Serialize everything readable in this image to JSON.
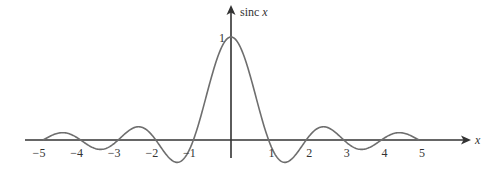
{
  "chart_data": {
    "type": "line",
    "title": "",
    "function": "sinc x = sin(πx)/(πx)",
    "xlabel": "x",
    "ylabel": "sinc x",
    "ylabel_parts": {
      "name": "sinc",
      "var": "x"
    },
    "x_ticks": [
      -5,
      -4,
      -3,
      -2,
      -1,
      1,
      2,
      3,
      4,
      5
    ],
    "x_tick_labels": [
      "−5",
      "−4",
      "−3",
      "−2",
      "−1",
      "1",
      "2",
      "3",
      "4",
      "5"
    ],
    "y_ticks": [
      1
    ],
    "y_tick_labels": [
      "1"
    ],
    "xlim": [
      -5,
      5
    ],
    "ylim": [
      -0.22,
      1
    ],
    "grid": false,
    "legend": null,
    "series": [
      {
        "name": "sinc x",
        "x": [
          -5,
          -4.5,
          -4,
          -3.5,
          -3,
          -2.5,
          -2,
          -1.5,
          -1,
          -0.5,
          0,
          0.5,
          1,
          1.5,
          2,
          2.5,
          3,
          3.5,
          4,
          4.5,
          5
        ],
        "values": [
          0,
          0.0707,
          0,
          -0.0909,
          0,
          0.1273,
          0,
          -0.2122,
          0,
          0.6366,
          1,
          0.6366,
          0,
          -0.2122,
          0,
          0.1273,
          0,
          -0.0909,
          0,
          0.0707,
          0
        ],
        "color": "#6e6e6e"
      }
    ],
    "colors": {
      "curve": "#6e6e6e",
      "axes": "#333333"
    }
  }
}
